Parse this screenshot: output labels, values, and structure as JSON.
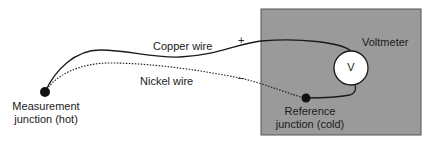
{
  "diagram": {
    "box": {
      "label": "Voltmeter",
      "fill": "#9a9a9a"
    },
    "meter": {
      "symbol": "V"
    },
    "wires": {
      "copper": {
        "label": "Copper wire",
        "polarity": "+",
        "style": "solid"
      },
      "nickel": {
        "label": "Nickel wire",
        "polarity": "–",
        "style": "dotted"
      }
    },
    "junctions": {
      "measurement": {
        "line1": "Measurement",
        "line2": "junction (hot)"
      },
      "reference": {
        "line1": "Reference",
        "line2": "junction (cold)"
      }
    }
  }
}
